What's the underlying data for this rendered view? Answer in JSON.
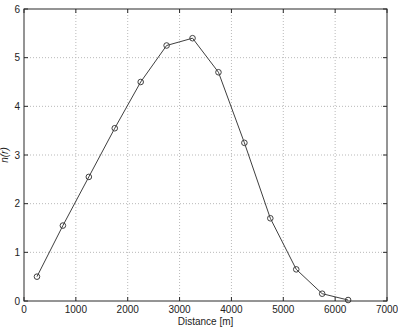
{
  "chart_data": {
    "type": "line",
    "title": "",
    "xlabel": "Distance [m]",
    "ylabel": "n(r)",
    "x": [
      250,
      750,
      1250,
      1750,
      2250,
      2750,
      3250,
      3750,
      4250,
      4750,
      5250,
      5750,
      6250
    ],
    "y": [
      0.5,
      1.55,
      2.55,
      3.55,
      4.5,
      5.25,
      5.4,
      4.7,
      3.25,
      1.7,
      0.65,
      0.15,
      0.02
    ],
    "xlim": [
      0,
      7000
    ],
    "ylim": [
      0,
      6
    ],
    "xticks": [
      0,
      1000,
      2000,
      3000,
      4000,
      5000,
      6000,
      7000
    ],
    "yticks": [
      0,
      1,
      2,
      3,
      4,
      5,
      6
    ],
    "grid": "dotted",
    "legend": null,
    "marker": "open-circle",
    "line_color": "#3f3f3f",
    "marker_color": "#3f3f3f",
    "grid_color": "#b9b9b9",
    "axis_color": "#2a2a2a",
    "background": "#ffffff"
  }
}
